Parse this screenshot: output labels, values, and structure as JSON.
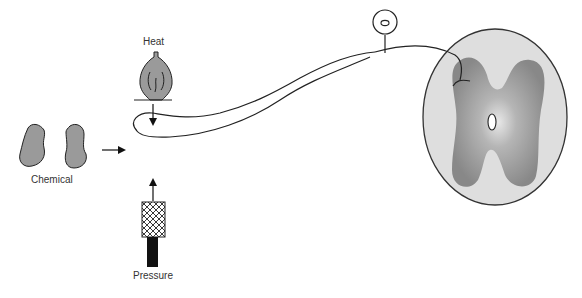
{
  "diagram": {
    "type": "sensory-receptor-pathway",
    "stimuli": [
      {
        "id": "heat",
        "label": "Heat",
        "icon": "flame-icon"
      },
      {
        "id": "chemical",
        "label": "Chemical",
        "icon": "molecule-icon"
      },
      {
        "id": "pressure",
        "label": "Pressure",
        "icon": "pressure-probe-icon"
      }
    ],
    "components": {
      "receptor_ending": "free-nerve-ending",
      "cell_body": "dorsal-root-ganglion-cell",
      "target": "spinal-cord-cross-section"
    },
    "colors": {
      "stroke": "#222222",
      "stimulus_fill": "#999999",
      "cord_outer": "#dcdcdc",
      "grey_matter": "#8f8f8f",
      "probe_dark": "#111111"
    }
  }
}
